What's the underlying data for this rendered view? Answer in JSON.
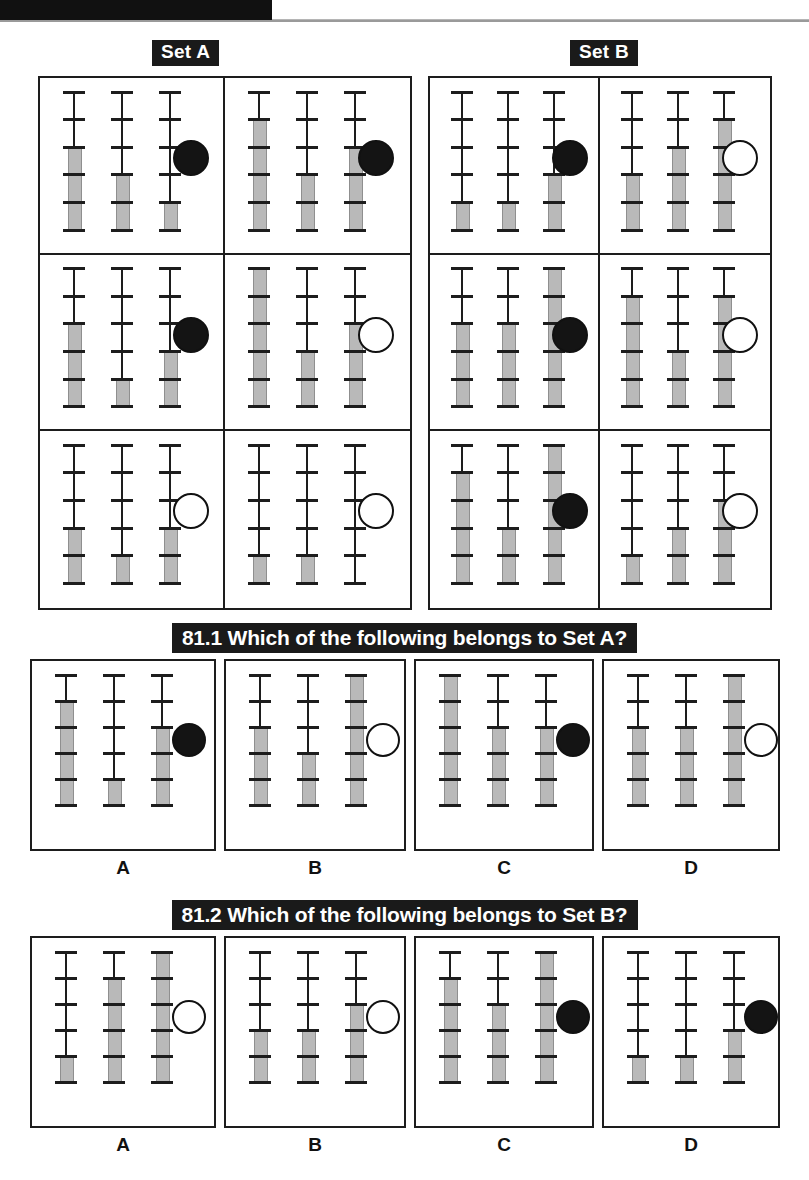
{
  "header": {
    "masthead_text": ""
  },
  "sets": {
    "a": {
      "label": "Set A",
      "cells": [
        {
          "gauges": [
            3,
            2,
            1
          ],
          "marker": "filled"
        },
        {
          "gauges": [
            4,
            2,
            3
          ],
          "marker": "filled"
        },
        {
          "gauges": [
            3,
            1,
            2
          ],
          "marker": "filled"
        },
        {
          "gauges": [
            5,
            2,
            3
          ],
          "marker": "hollow"
        },
        {
          "gauges": [
            2,
            1,
            2
          ],
          "marker": "hollow"
        },
        {
          "gauges": [
            1,
            1,
            0
          ],
          "marker": "hollow"
        }
      ]
    },
    "b": {
      "label": "Set B",
      "cells": [
        {
          "gauges": [
            1,
            1,
            2
          ],
          "marker": "filled"
        },
        {
          "gauges": [
            2,
            3,
            4
          ],
          "marker": "hollow"
        },
        {
          "gauges": [
            3,
            3,
            5
          ],
          "marker": "filled"
        },
        {
          "gauges": [
            4,
            2,
            4
          ],
          "marker": "hollow"
        },
        {
          "gauges": [
            4,
            2,
            5
          ],
          "marker": "filled"
        },
        {
          "gauges": [
            1,
            2,
            3
          ],
          "marker": "hollow"
        }
      ]
    }
  },
  "questions": [
    {
      "number": "81.1",
      "text": "81.1 Which of the following belongs to Set A?",
      "options": [
        {
          "label": "A",
          "gauges": [
            4,
            1,
            3
          ],
          "marker": "filled"
        },
        {
          "label": "B",
          "gauges": [
            3,
            2,
            5
          ],
          "marker": "hollow"
        },
        {
          "label": "C",
          "gauges": [
            5,
            3,
            3
          ],
          "marker": "filled"
        },
        {
          "label": "D",
          "gauges": [
            3,
            3,
            5
          ],
          "marker": "hollow"
        }
      ]
    },
    {
      "number": "81.2",
      "text": "81.2 Which of the following belongs to Set B?",
      "options": [
        {
          "label": "A",
          "gauges": [
            1,
            4,
            5
          ],
          "marker": "hollow"
        },
        {
          "label": "B",
          "gauges": [
            2,
            2,
            3
          ],
          "marker": "hollow"
        },
        {
          "label": "C",
          "gauges": [
            4,
            3,
            5
          ],
          "marker": "filled"
        },
        {
          "label": "D",
          "gauges": [
            1,
            1,
            2
          ],
          "marker": "filled"
        }
      ]
    }
  ],
  "gauge_spec": {
    "ticks": 6,
    "segments": 5
  },
  "colors": {
    "ink": "#1d1d1d",
    "fill": "#b9b9b9",
    "chip_bg": "#1a1a1a",
    "chip_fg": "#ffffff"
  },
  "chart_data": {
    "type": "table",
    "columns": [
      "group",
      "cell",
      "gauge1",
      "gauge2",
      "gauge3",
      "marker"
    ],
    "rows": [
      [
        "Set A",
        1,
        3,
        2,
        1,
        "filled"
      ],
      [
        "Set A",
        2,
        4,
        2,
        3,
        "filled"
      ],
      [
        "Set A",
        3,
        3,
        1,
        2,
        "filled"
      ],
      [
        "Set A",
        4,
        5,
        2,
        3,
        "hollow"
      ],
      [
        "Set A",
        5,
        2,
        1,
        2,
        "hollow"
      ],
      [
        "Set A",
        6,
        1,
        1,
        0,
        "hollow"
      ],
      [
        "Set B",
        1,
        1,
        1,
        2,
        "filled"
      ],
      [
        "Set B",
        2,
        2,
        3,
        4,
        "hollow"
      ],
      [
        "Set B",
        3,
        3,
        3,
        5,
        "filled"
      ],
      [
        "Set B",
        4,
        4,
        2,
        4,
        "hollow"
      ],
      [
        "Set B",
        5,
        4,
        2,
        5,
        "filled"
      ],
      [
        "Set B",
        6,
        1,
        2,
        3,
        "hollow"
      ],
      [
        "81.1 option",
        "A",
        4,
        1,
        3,
        "filled"
      ],
      [
        "81.1 option",
        "B",
        3,
        2,
        5,
        "hollow"
      ],
      [
        "81.1 option",
        "C",
        5,
        3,
        3,
        "filled"
      ],
      [
        "81.1 option",
        "D",
        3,
        3,
        5,
        "hollow"
      ],
      [
        "81.2 option",
        "A",
        1,
        4,
        5,
        "hollow"
      ],
      [
        "81.2 option",
        "B",
        2,
        2,
        3,
        "hollow"
      ],
      [
        "81.2 option",
        "C",
        4,
        3,
        5,
        "filled"
      ],
      [
        "81.2 option",
        "D",
        1,
        1,
        2,
        "filled"
      ]
    ],
    "ylim": [
      0,
      5
    ],
    "ylabel": "gauge level (segments filled of 5)",
    "grid": false
  }
}
